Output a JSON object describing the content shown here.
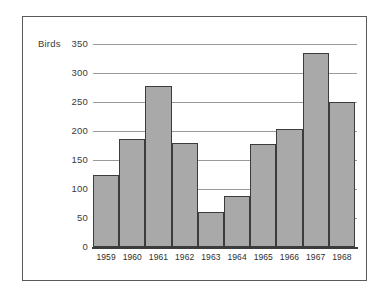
{
  "chart_data": {
    "type": "bar",
    "title": "",
    "xlabel": "",
    "ylabel": "Birds",
    "ylim": [
      0,
      350
    ],
    "yticks": [
      0,
      50,
      100,
      150,
      200,
      250,
      300,
      350
    ],
    "grid": true,
    "legend": "none",
    "categories": [
      "1959",
      "1960",
      "1961",
      "1962",
      "1963",
      "1964",
      "1965",
      "1966",
      "1967",
      "1968"
    ],
    "values": [
      125,
      187,
      277,
      180,
      60,
      88,
      178,
      203,
      335,
      250
    ],
    "series": [
      {
        "name": "Birds",
        "values": [
          125,
          187,
          277,
          180,
          60,
          88,
          178,
          203,
          335,
          250
        ]
      }
    ],
    "bar_fill_color": "#a9a9a9",
    "bar_edge_color": "#3c3c3c",
    "gridline_color": "#9a9a9a",
    "axis_color": "#3c3c3c",
    "frame_color": "#5a5a5a",
    "background_color": "#ffffff"
  }
}
